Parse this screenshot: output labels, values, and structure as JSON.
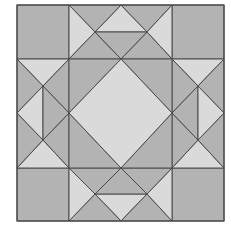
{
  "diagram": {
    "title": "",
    "type": "quilt-block",
    "colors": {
      "medium": "#b3b3b3",
      "light": "#dadada",
      "line": "#4a4a4a",
      "background": "#ffffff"
    },
    "bounds": {
      "x0": 17,
      "y0": 5,
      "x1": 224,
      "y1": 221
    },
    "pieces": [
      {
        "name": "corner-top-left",
        "fill": "medium",
        "points": "17,5 69,5 69,59 17,59"
      },
      {
        "name": "corner-top-right",
        "fill": "medium",
        "points": "172,5 224,5 224,59 172,59"
      },
      {
        "name": "corner-bottom-left",
        "fill": "medium",
        "points": "17,168 69,168 69,221 17,221"
      },
      {
        "name": "corner-bottom-right",
        "fill": "medium",
        "points": "172,168 224,168 224,221 172,221"
      },
      {
        "name": "top-apex-triangle",
        "fill": "light",
        "points": "121,5 147,32 95,32"
      },
      {
        "name": "top-outer-left",
        "fill": "medium",
        "points": "69,5 121,5 95,32"
      },
      {
        "name": "top-outer-right",
        "fill": "medium",
        "points": "121,5 172,5 147,32"
      },
      {
        "name": "top-side-left",
        "fill": "light",
        "points": "69,5 95,32 69,59"
      },
      {
        "name": "top-side-right",
        "fill": "light",
        "points": "172,5 172,59 147,32"
      },
      {
        "name": "top-inner-left",
        "fill": "medium",
        "points": "69,59 95,32 121,59"
      },
      {
        "name": "top-inner-right",
        "fill": "medium",
        "points": "121,59 147,32 172,59"
      },
      {
        "name": "top-inner-center",
        "fill": "medium",
        "points": "95,32 147,32 121,59"
      },
      {
        "name": "bottom-apex-triangle",
        "fill": "light",
        "points": "95,194 147,194 121,221"
      },
      {
        "name": "bottom-outer-left",
        "fill": "medium",
        "points": "69,221 95,194 121,221"
      },
      {
        "name": "bottom-outer-right",
        "fill": "medium",
        "points": "121,221 147,194 172,221"
      },
      {
        "name": "bottom-side-left",
        "fill": "light",
        "points": "69,168 95,194 69,221"
      },
      {
        "name": "bottom-side-right",
        "fill": "light",
        "points": "172,168 172,221 147,194"
      },
      {
        "name": "bottom-inner-left",
        "fill": "medium",
        "points": "69,168 121,168 95,194"
      },
      {
        "name": "bottom-inner-right",
        "fill": "medium",
        "points": "121,168 172,168 147,194"
      },
      {
        "name": "bottom-inner-center",
        "fill": "medium",
        "points": "121,168 147,194 95,194"
      },
      {
        "name": "left-top-triangle",
        "fill": "light",
        "points": "17,59 69,59 43,86"
      },
      {
        "name": "left-bottom-triangle",
        "fill": "light",
        "points": "17,168 43,140 69,168"
      },
      {
        "name": "left-outer-upper",
        "fill": "medium",
        "points": "17,59 43,86 17,113"
      },
      {
        "name": "left-outer-lower",
        "fill": "medium",
        "points": "17,113 43,140 17,168"
      },
      {
        "name": "left-inner-upper",
        "fill": "medium",
        "points": "69,59 69,113 43,86"
      },
      {
        "name": "left-inner-lower",
        "fill": "medium",
        "points": "69,113 69,168 43,140"
      },
      {
        "name": "left-diamond-left-half",
        "fill": "light",
        "points": "43,86 43,140 17,113"
      },
      {
        "name": "left-diamond-right-half",
        "fill": "medium",
        "points": "43,86 69,113 43,140"
      },
      {
        "name": "right-top-triangle",
        "fill": "light",
        "points": "172,59 224,59 198,86"
      },
      {
        "name": "right-bottom-triangle",
        "fill": "light",
        "points": "172,168 198,140 224,168"
      },
      {
        "name": "right-outer-upper",
        "fill": "medium",
        "points": "224,59 224,113 198,86"
      },
      {
        "name": "right-outer-lower",
        "fill": "medium",
        "points": "224,113 224,168 198,140"
      },
      {
        "name": "right-inner-upper",
        "fill": "medium",
        "points": "172,59 198,86 172,113"
      },
      {
        "name": "right-inner-lower",
        "fill": "medium",
        "points": "172,113 198,140 172,168"
      },
      {
        "name": "right-diamond-left-half",
        "fill": "medium",
        "points": "198,86 198,140 172,113"
      },
      {
        "name": "right-diamond-right-half",
        "fill": "light",
        "points": "198,86 224,113 198,140"
      },
      {
        "name": "center-corner-top-left",
        "fill": "medium",
        "points": "69,59 121,59 69,113"
      },
      {
        "name": "center-corner-top-right",
        "fill": "medium",
        "points": "121,59 172,59 172,113"
      },
      {
        "name": "center-corner-bottom-left",
        "fill": "medium",
        "points": "69,113 121,168 69,168"
      },
      {
        "name": "center-corner-bottom-right",
        "fill": "medium",
        "points": "172,113 172,168 121,168"
      },
      {
        "name": "center-diamond",
        "fill": "light",
        "points": "121,59 172,113 121,168 69,113"
      }
    ]
  }
}
